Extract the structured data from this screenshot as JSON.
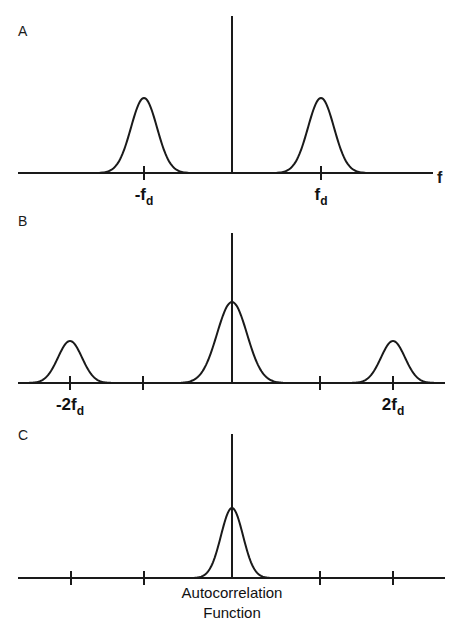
{
  "figure": {
    "width": 464,
    "height": 629,
    "background": "#ffffff",
    "stroke_color": "#1a1a1a"
  },
  "panels": [
    {
      "id": "A",
      "label": "A",
      "label_x": 18,
      "label_y": 36,
      "baseline_y": 173,
      "axis_x0": 18,
      "axis_x1": 433,
      "center_x": 232,
      "axis_label": "f",
      "axis_label_x": 437,
      "axis_label_y": 183,
      "spike": {
        "x": 232,
        "top_y": 16
      },
      "ticks": [
        {
          "x": 144,
          "label": "-f",
          "sub": "d"
        },
        {
          "x": 321,
          "label": "f",
          "sub": "d"
        }
      ],
      "peaks": [
        {
          "center_x": 144,
          "height": 75,
          "sigma": 13
        },
        {
          "center_x": 321,
          "height": 75,
          "sigma": 13
        }
      ]
    },
    {
      "id": "B",
      "label": "B",
      "label_x": 18,
      "label_y": 226,
      "baseline_y": 383,
      "axis_x0": 18,
      "axis_x1": 445,
      "center_x": 232,
      "axis_label": "",
      "axis_label_x": 0,
      "axis_label_y": 0,
      "spike": {
        "x": 232,
        "top_y": 233
      },
      "ticks": [
        {
          "x": 70,
          "label": "-2f",
          "sub": "d"
        },
        {
          "x": 143,
          "label": "",
          "sub": ""
        },
        {
          "x": 320,
          "label": "",
          "sub": ""
        },
        {
          "x": 393,
          "label": "2f",
          "sub": "d"
        }
      ],
      "peaks": [
        {
          "center_x": 70,
          "height": 42,
          "sigma": 12
        },
        {
          "center_x": 232,
          "height": 81,
          "sigma": 15
        },
        {
          "center_x": 393,
          "height": 42,
          "sigma": 12
        }
      ]
    },
    {
      "id": "C",
      "label": "C",
      "label_x": 18,
      "label_y": 440,
      "baseline_y": 578,
      "axis_x0": 18,
      "axis_x1": 445,
      "center_x": 232,
      "axis_label": "",
      "axis_label_x": 0,
      "axis_label_y": 0,
      "spike": {
        "x": 232,
        "top_y": 434
      },
      "ticks": [
        {
          "x": 71,
          "label": "",
          "sub": ""
        },
        {
          "x": 144,
          "label": "",
          "sub": ""
        },
        {
          "x": 320,
          "label": "",
          "sub": ""
        },
        {
          "x": 393,
          "label": "",
          "sub": ""
        }
      ],
      "peaks": [
        {
          "center_x": 232,
          "height": 70,
          "sigma": 11
        }
      ]
    }
  ],
  "caption": {
    "line1": "Autocorrelation",
    "line2": "Function",
    "x": 232,
    "line1_y": 598,
    "line2_y": 618
  },
  "chart_data": {
    "type": "line",
    "title": "",
    "panels": [
      {
        "id": "A",
        "label": "A",
        "xlabel": "f",
        "ylabel": "",
        "grid": false,
        "legend": null,
        "tick_labels": [
          "-f_d",
          "f_d"
        ],
        "tick_positions": [
          -1,
          1
        ],
        "xlim": [
          -2.3,
          2.3
        ],
        "ylim": [
          0,
          1.0
        ],
        "annotations": [
          "f"
        ],
        "series": [
          {
            "name": "dc-impulse",
            "type": "impulse",
            "x": [
              0
            ],
            "values": [
              1.0
            ]
          },
          {
            "name": "doppler-sidebands",
            "type": "gaussian-peaks",
            "x": [
              -1,
              1
            ],
            "values": [
              0.48,
              0.48
            ],
            "sigma": 0.155
          }
        ]
      },
      {
        "id": "B",
        "label": "B",
        "xlabel": "",
        "ylabel": "",
        "grid": false,
        "legend": null,
        "tick_labels": [
          "-2f_d",
          "",
          "",
          "2f_d"
        ],
        "tick_positions": [
          -2,
          -1,
          1,
          2
        ],
        "xlim": [
          -2.6,
          2.6
        ],
        "ylim": [
          0,
          1.0
        ],
        "annotations": [],
        "series": [
          {
            "name": "dc-impulse",
            "type": "impulse",
            "x": [
              0
            ],
            "values": [
              1.0
            ]
          },
          {
            "name": "center-lobe",
            "type": "gaussian-peaks",
            "x": [
              0
            ],
            "values": [
              0.54
            ],
            "sigma": 0.18
          },
          {
            "name": "second-order-sidebands",
            "type": "gaussian-peaks",
            "x": [
              -2,
              2
            ],
            "values": [
              0.28,
              0.28
            ],
            "sigma": 0.145
          }
        ]
      },
      {
        "id": "C",
        "label": "C",
        "xlabel": "",
        "ylabel": "",
        "grid": false,
        "legend": null,
        "tick_labels": [
          "",
          "",
          "",
          ""
        ],
        "tick_positions": [
          -2,
          -1,
          1,
          2
        ],
        "xlim": [
          -2.6,
          2.6
        ],
        "ylim": [
          0,
          1.0
        ],
        "annotations": [
          "Autocorrelation Function"
        ],
        "series": [
          {
            "name": "dc-impulse",
            "type": "impulse",
            "x": [
              0
            ],
            "values": [
              1.0
            ]
          },
          {
            "name": "autocorrelation-lobe",
            "type": "gaussian-peaks",
            "x": [
              0
            ],
            "values": [
              0.48
            ],
            "sigma": 0.135
          }
        ]
      }
    ]
  }
}
